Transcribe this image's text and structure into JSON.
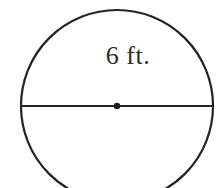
{
  "figure": {
    "caption_label": "6 ft.",
    "shape_name": "circle",
    "colors": {
      "background": "#ffffff",
      "stroke": "#232323",
      "label_text": "#2b2b2b",
      "center_dot": "#1a1a1a"
    },
    "geometry": {
      "canvas_width": 220,
      "canvas_height": 188,
      "center_x": 117,
      "center_y": 106,
      "radius": 96,
      "circle_stroke_width": 2.2,
      "diameter_stroke_width": 2.0,
      "center_dot_radius": 3.2,
      "diameter_y": 106,
      "diameter_x_start": 21,
      "diameter_x_end": 213,
      "top_y": 10,
      "bottom_y_clipped": 188
    },
    "elements": {
      "circle_outline_name": "circle outline",
      "diameter_segment_name": "diameter segment",
      "center_point_name": "center point",
      "dimension_label_name": "dimension label"
    },
    "measurement": {
      "value": 6,
      "unit": "ft.",
      "quantity": "diameter"
    }
  }
}
